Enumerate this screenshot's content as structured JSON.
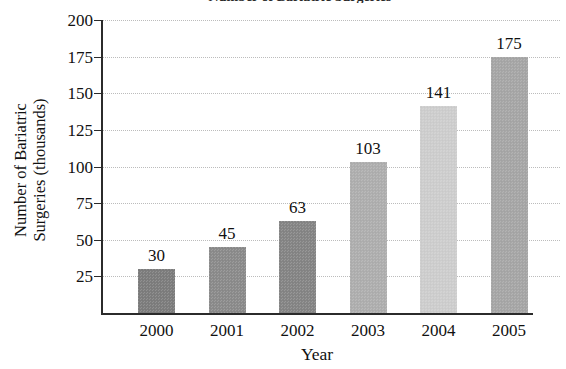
{
  "figure": {
    "title_cutoff": "Number of Bariatric Surgeries",
    "title_visible": false
  },
  "chart_data": {
    "type": "bar",
    "title": "",
    "categories": [
      "2000",
      "2001",
      "2002",
      "2003",
      "2004",
      "2005"
    ],
    "values": [
      30,
      45,
      63,
      103,
      141,
      175
    ],
    "value_labels": [
      "30",
      "45",
      "63",
      "103",
      "141",
      "175"
    ],
    "xlabel": "Year",
    "ylabel_line1": "Number of Bariatric",
    "ylabel_line2": "Surgeries (thousands)",
    "ylim": [
      0,
      200
    ],
    "ytick_values": [
      200,
      175,
      150,
      125,
      100,
      75,
      50,
      25
    ],
    "ytick_labels": [
      "200",
      "175",
      "150",
      "125",
      "100",
      "75",
      "50",
      "25"
    ],
    "grid": "horizontal-dotted",
    "legend": "none",
    "bar_colors": [
      "#7e7e7e",
      "#8c8c8c",
      "#868686",
      "#b0b0b0",
      "#d0d0d0",
      "#a8a8a8"
    ],
    "axis_color": "#2b2b2b",
    "gridline_color": "#bcbcbc"
  }
}
